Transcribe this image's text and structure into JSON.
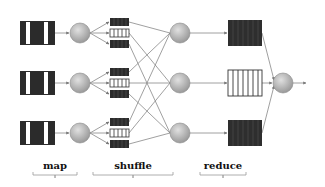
{
  "labels": {
    "map": "map",
    "shuffle": "shuffle",
    "reduce": "reduce"
  },
  "colors": {
    "queue_dark": "#2b2b2b",
    "queue_light": "#ffffff",
    "node_fill": "#bdbdbd",
    "line": "#777777"
  },
  "rows": [
    {
      "map_queue": "dark-striped",
      "shuffle_queues": [
        "dark",
        "light",
        "dark"
      ],
      "reduce_queue": "dark"
    },
    {
      "map_queue": "dark-striped",
      "shuffle_queues": [
        "dark",
        "light",
        "dark"
      ],
      "reduce_queue": "light"
    },
    {
      "map_queue": "dark-striped",
      "shuffle_queues": [
        "dark",
        "light",
        "dark"
      ],
      "reduce_queue": "dark"
    }
  ]
}
